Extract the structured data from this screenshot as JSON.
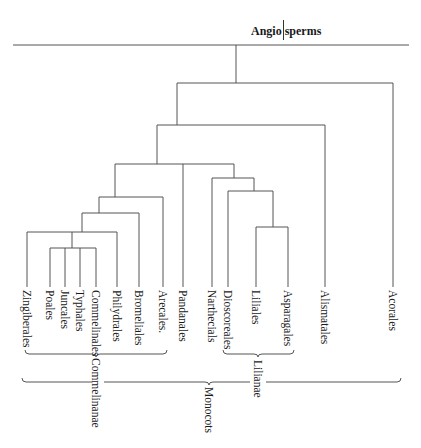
{
  "title": {
    "left": "Angio",
    "right": "sperms"
  },
  "taxa": [
    {
      "name": "Zingiberales",
      "x": 27
    },
    {
      "name": "Poales",
      "x": 50
    },
    {
      "name": "Juncales",
      "x": 65
    },
    {
      "name": "Typhales",
      "x": 80
    },
    {
      "name": "Commelinales",
      "x": 96
    },
    {
      "name": "Philydrales",
      "x": 117
    },
    {
      "name": "Bromeliales",
      "x": 139
    },
    {
      "name": "Arecales.",
      "x": 163
    },
    {
      "name": "Pandanales",
      "x": 183
    },
    {
      "name": "Narthecials",
      "x": 212
    },
    {
      "name": "Dioscoreales",
      "x": 228
    },
    {
      "name": "Liliales",
      "x": 256
    },
    {
      "name": "Asparagales",
      "x": 288
    },
    {
      "name": "Alismatales",
      "x": 325
    },
    {
      "name": "Acorales",
      "x": 393
    }
  ],
  "groups": [
    {
      "name": "Commelinanae",
      "from_x": 25,
      "to_x": 167,
      "y": 354,
      "tip_x": 96,
      "label_y": 358
    },
    {
      "name": "Lilianae",
      "from_x": 223,
      "to_x": 294,
      "y": 354,
      "tip_x": 258,
      "label_y": 360
    },
    {
      "name": "Monocots",
      "from_x": 22,
      "to_x": 401,
      "y": 382,
      "tip_x": 209,
      "label_y": 387
    }
  ]
}
